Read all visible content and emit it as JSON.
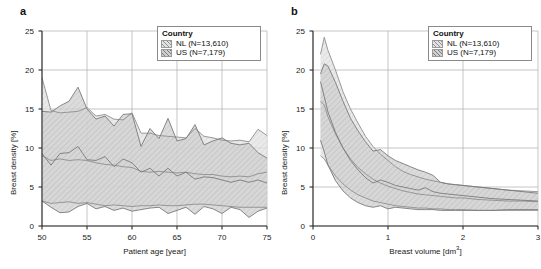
{
  "figure": {
    "background": "#ffffff",
    "panels": [
      {
        "label": "a",
        "xlabel": "Patient age [year]",
        "ylabel": "Breast density [%]",
        "xticks": [
          "50",
          "55",
          "60",
          "65",
          "70",
          "75"
        ],
        "yticks": [
          "0",
          "5",
          "10",
          "15",
          "20",
          "25"
        ],
        "legend": {
          "title": "Country",
          "entries": [
            {
              "label": "NL (N=13,610)",
              "fill": "#e3e3e3",
              "line": "#8f8f8f"
            },
            {
              "label": "US (N=7,179)",
              "fill": "#d0d0d0",
              "line": "#7a7a7a"
            }
          ]
        }
      },
      {
        "label": "b",
        "xlabel_text": "Breast volume [dm",
        "xlabel_sup": "3",
        "xlabel_tail": "]",
        "xlabel": "Breast volume [dm3]",
        "ylabel": "Breast density [%]",
        "xticks": [
          "0",
          "1",
          "2",
          "3"
        ],
        "yticks": [
          "0",
          "5",
          "10",
          "15",
          "20",
          "25"
        ],
        "legend": {
          "title": "Country",
          "entries": [
            {
              "label": "NL (N=13,610)",
              "fill": "#e3e3e3",
              "line": "#8f8f8f"
            },
            {
              "label": "US (N=7,179)",
              "fill": "#d0d0d0",
              "line": "#7a7a7a"
            }
          ]
        }
      }
    ]
  },
  "chart_data": [
    {
      "type": "line",
      "panel": "a",
      "title": "",
      "xlabel": "Patient age [year]",
      "ylabel": "Breast density [%]",
      "xlim": [
        50,
        75
      ],
      "ylim": [
        0,
        25
      ],
      "grid": true,
      "legend_position": "top-right",
      "x": [
        50,
        51,
        52,
        53,
        54,
        55,
        56,
        57,
        58,
        59,
        60,
        61,
        62,
        63,
        64,
        65,
        66,
        67,
        68,
        69,
        70,
        71,
        72,
        73,
        74,
        75
      ],
      "series": [
        {
          "name": "NL (N=13,610) upper percentile",
          "values": [
            19.0,
            14.8,
            14.5,
            14.6,
            14.7,
            15.2,
            14.1,
            14.3,
            13.7,
            13.6,
            14.5,
            11.9,
            11.9,
            11.6,
            11.5,
            11.4,
            11.3,
            12.5,
            11.5,
            11.3,
            11.0,
            10.9,
            11.0,
            10.8,
            12.4,
            11.6
          ]
        },
        {
          "name": "NL (N=13,610) median",
          "values": [
            9.0,
            8.4,
            8.6,
            8.4,
            8.5,
            8.4,
            8.1,
            7.9,
            7.8,
            7.6,
            7.5,
            7.0,
            6.9,
            7.0,
            6.9,
            6.8,
            6.9,
            6.7,
            6.6,
            6.6,
            6.4,
            6.3,
            6.4,
            6.3,
            6.7,
            6.9
          ]
        },
        {
          "name": "NL (N=13,610) lower percentile",
          "values": [
            3.2,
            2.9,
            3.0,
            3.1,
            2.9,
            3.0,
            2.8,
            2.6,
            2.7,
            2.6,
            2.5,
            2.6,
            2.6,
            2.7,
            2.6,
            2.6,
            2.7,
            2.8,
            2.8,
            2.7,
            2.6,
            2.5,
            2.4,
            2.4,
            2.4,
            2.4
          ]
        },
        {
          "name": "US (N=7,179) upper percentile",
          "values": [
            14.7,
            14.6,
            15.4,
            16.0,
            17.8,
            15.0,
            13.7,
            14.1,
            12.8,
            14.3,
            14.4,
            10.2,
            12.5,
            11.2,
            13.8,
            10.9,
            11.2,
            13.0,
            10.4,
            10.9,
            11.3,
            10.6,
            10.4,
            10.6,
            9.4,
            8.7
          ]
        },
        {
          "name": "US (N=7,179) median",
          "values": [
            9.3,
            7.8,
            9.3,
            9.4,
            10.2,
            8.5,
            8.4,
            8.9,
            7.6,
            8.6,
            8.1,
            6.9,
            7.4,
            6.4,
            7.4,
            6.4,
            6.9,
            6.0,
            6.3,
            6.2,
            5.9,
            5.6,
            5.9,
            5.6,
            5.9,
            5.5
          ]
        },
        {
          "name": "US (N=7,179) lower percentile",
          "values": [
            3.2,
            2.4,
            1.7,
            1.8,
            2.5,
            2.9,
            2.2,
            2.5,
            2.0,
            2.3,
            1.9,
            2.1,
            2.3,
            2.4,
            1.6,
            2.0,
            2.4,
            1.5,
            2.5,
            2.2,
            1.6,
            2.4,
            2.1,
            1.1,
            1.9,
            2.3
          ]
        }
      ]
    },
    {
      "type": "line",
      "panel": "b",
      "title": "",
      "xlabel": "Breast volume [dm3]",
      "ylabel": "Breast density [%]",
      "xlim": [
        0,
        3
      ],
      "ylim": [
        0,
        25
      ],
      "grid": true,
      "legend_position": "top-right",
      "x": [
        0.1,
        0.15,
        0.2,
        0.3,
        0.4,
        0.5,
        0.6,
        0.7,
        0.8,
        0.9,
        1.0,
        1.1,
        1.2,
        1.3,
        1.4,
        1.5,
        1.6,
        1.7,
        1.8,
        1.9,
        2.0,
        2.2,
        2.4,
        2.6,
        2.8,
        3.0
      ],
      "series": [
        {
          "name": "NL (N=13,610) upper percentile",
          "values": [
            22.0,
            24.2,
            22.5,
            20.0,
            17.2,
            15.0,
            13.2,
            11.5,
            10.2,
            9.2,
            8.4,
            7.6,
            7.0,
            6.6,
            6.3,
            6.0,
            5.8,
            5.6,
            5.4,
            5.3,
            5.2,
            5.0,
            4.8,
            4.6,
            4.5,
            4.4
          ]
        },
        {
          "name": "NL (N=13,610) median",
          "values": [
            16.0,
            15.5,
            14.0,
            11.8,
            10.0,
            8.6,
            7.5,
            6.7,
            6.0,
            5.5,
            5.1,
            4.8,
            4.5,
            4.3,
            4.1,
            4.0,
            3.9,
            3.8,
            3.7,
            3.6,
            3.6,
            3.4,
            3.3,
            3.2,
            3.2,
            3.1
          ]
        },
        {
          "name": "NL (N=13,610) lower percentile",
          "values": [
            9.0,
            8.6,
            7.8,
            6.4,
            5.4,
            4.6,
            4.0,
            3.6,
            3.2,
            3.0,
            2.8,
            2.6,
            2.5,
            2.4,
            2.3,
            2.3,
            2.2,
            2.2,
            2.1,
            2.1,
            2.1,
            2.0,
            2.0,
            2.0,
            2.0,
            2.0
          ]
        },
        {
          "name": "US (N=7,179) upper percentile",
          "values": [
            19.5,
            20.8,
            20.5,
            18.4,
            16.0,
            13.8,
            12.2,
            10.8,
            9.6,
            9.8,
            9.0,
            8.4,
            8.0,
            7.6,
            7.2,
            6.9,
            6.5,
            5.6,
            5.4,
            5.3,
            5.2,
            5.0,
            4.8,
            4.6,
            4.4,
            4.2
          ]
        },
        {
          "name": "US (N=7,179) median",
          "values": [
            18.5,
            16.6,
            14.6,
            12.0,
            10.0,
            8.4,
            7.2,
            6.2,
            5.5,
            5.9,
            5.6,
            5.2,
            5.0,
            4.8,
            4.6,
            4.9,
            4.4,
            4.2,
            4.1,
            4.0,
            3.9,
            3.7,
            3.5,
            3.4,
            3.3,
            3.2
          ]
        },
        {
          "name": "US (N=7,179) lower percentile",
          "values": [
            11.0,
            9.5,
            7.8,
            5.8,
            4.5,
            3.6,
            3.0,
            2.6,
            2.4,
            2.6,
            2.2,
            2.4,
            2.3,
            2.2,
            2.1,
            2.1,
            2.1,
            2.0,
            2.0,
            2.0,
            2.0,
            2.0,
            2.0,
            2.1,
            2.1,
            2.1
          ]
        }
      ]
    }
  ]
}
